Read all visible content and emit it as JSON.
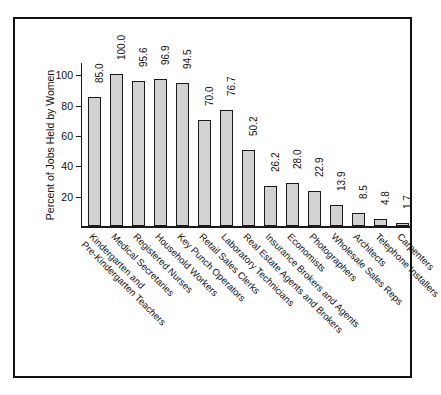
{
  "chart_data": {
    "type": "bar",
    "title": "",
    "xlabel": "",
    "ylabel": "Percent of Jobs Held by Women",
    "ylim": [
      0,
      108
    ],
    "yticks": [
      20,
      40,
      60,
      80,
      100
    ],
    "ytick_labels": [
      "20",
      "40",
      "60",
      "80",
      "100"
    ],
    "grid": false,
    "legend": "none",
    "value_label_format": "one-decimal",
    "value_label_rotation": 90,
    "category_label_rotation": 45,
    "bar_fill_color": "#d2d2d2",
    "bar_edge_color": "#1a1a1a",
    "categories": [
      "Kindergarten and\nPre-Kindergarten Teachers",
      "Medical Secretaries",
      "Registered Nurses",
      "Household Workers",
      "Key Punch Operators",
      "Retail Sales Clerks",
      "Laboratory Technicians",
      "Real Estate Agents and Brokers",
      "Insurance Brokers and Agents",
      "Economists",
      "Photographers",
      "Wholesale Sales Reps",
      "Architects",
      "Telephone Installers",
      "Carpenters"
    ],
    "category_lines": [
      [
        "Kindergarten and",
        "Pre-Kindergarten Teachers"
      ],
      [
        "Medical Secretaries"
      ],
      [
        "Registered Nurses"
      ],
      [
        "Household Workers"
      ],
      [
        "Key Punch Operators"
      ],
      [
        "Retail Sales Clerks"
      ],
      [
        "Laboratory Technicians"
      ],
      [
        "Real Estate Agents and Brokers"
      ],
      [
        "Insurance Brokers and Agents"
      ],
      [
        "Economists"
      ],
      [
        "Photographers"
      ],
      [
        "Wholesale Sales Reps"
      ],
      [
        "Architects"
      ],
      [
        "Telephone Installers"
      ],
      [
        "Carpenters"
      ]
    ],
    "values": [
      85.0,
      100.0,
      95.6,
      96.9,
      94.5,
      70.0,
      76.7,
      50.2,
      26.2,
      28.0,
      22.9,
      13.9,
      8.5,
      4.8,
      1.7
    ],
    "value_labels": [
      "85.0",
      "100.0",
      "95.6",
      "96.9",
      "94.5",
      "70.0",
      "76.7",
      "50.2",
      "26.2",
      "28.0",
      "22.9",
      "13.9",
      "8.5",
      "4.8",
      "1.7"
    ]
  }
}
